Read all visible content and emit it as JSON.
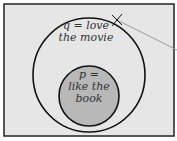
{
  "diagram": {
    "type": "venn",
    "outer_set": {
      "label_line1": "q = love",
      "label_line2": "the movie"
    },
    "inner_set": {
      "label_line1": "p =",
      "label_line2": "like the",
      "label_line3": "book"
    },
    "colors": {
      "background": "#e6e6e6",
      "inner_fill": "#b8b8b8",
      "stroke": "#111111",
      "pointer": "#999999"
    }
  }
}
